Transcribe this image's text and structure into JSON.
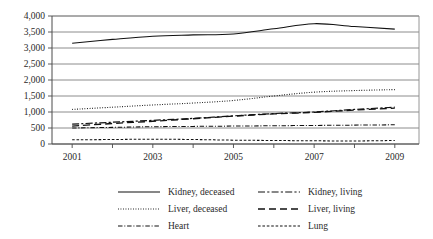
{
  "chart_data": {
    "type": "line",
    "title": "",
    "subtitle": "",
    "xlabel": "",
    "ylabel": "",
    "x": [
      2001,
      2002,
      2003,
      2004,
      2005,
      2006,
      2007,
      2008,
      2009
    ],
    "xlim": [
      2000.5,
      2009.6
    ],
    "ylim": [
      0,
      4000
    ],
    "ytick_values": [
      0,
      500,
      1000,
      1500,
      2000,
      2500,
      3000,
      3500,
      4000
    ],
    "ytick_labels": [
      "0",
      "500",
      "1,000",
      "1,500",
      "2,000",
      "2,500",
      "3,000",
      "3,500",
      "4,000"
    ],
    "xtick_values": [
      2001,
      2002,
      2003,
      2004,
      2005,
      2006,
      2007,
      2008,
      2009
    ],
    "xtick_labels": [
      "2001",
      "",
      "2003",
      "",
      "2005",
      "",
      "2007",
      "",
      "2009"
    ],
    "xtick_labels_shown": [
      "2001",
      "2003",
      "2005",
      "2007",
      "2009"
    ],
    "grid": "horizontal",
    "legend_position": "bottom",
    "series": [
      {
        "name": "Kidney, deceased",
        "dash": "solid",
        "values": [
          3150,
          3270,
          3370,
          3410,
          3440,
          3600,
          3760,
          3670,
          3590
        ]
      },
      {
        "name": "Kidney, living",
        "dash": "long-dash-dot",
        "values": [
          620,
          680,
          740,
          800,
          880,
          950,
          1000,
          1080,
          1150
        ]
      },
      {
        "name": "Liver, deceased",
        "dash": "dotted",
        "values": [
          1080,
          1150,
          1220,
          1280,
          1360,
          1500,
          1620,
          1670,
          1700
        ]
      },
      {
        "name": "Liver, living",
        "dash": "dashed",
        "values": [
          560,
          640,
          710,
          790,
          870,
          940,
          990,
          1060,
          1120
        ]
      },
      {
        "name": "Heart",
        "dash": "dash-dot",
        "values": [
          500,
          520,
          540,
          550,
          560,
          570,
          580,
          590,
          600
        ]
      },
      {
        "name": "Lung",
        "dash": "short-dash",
        "values": [
          130,
          140,
          150,
          140,
          120,
          110,
          100,
          95,
          110
        ]
      }
    ]
  },
  "legend": {
    "entries": [
      {
        "label": "Kidney, deceased",
        "dash": "solid"
      },
      {
        "label": "Kidney, living",
        "dash": "long-dash-dot"
      },
      {
        "label": "Liver, deceased",
        "dash": "dotted"
      },
      {
        "label": "Liver, living",
        "dash": "dashed"
      },
      {
        "label": "Heart",
        "dash": "dash-dot"
      },
      {
        "label": "Lung",
        "dash": "short-dash"
      }
    ]
  },
  "colors": {
    "line": "#111111",
    "grid": "#6e6e6e",
    "axis": "#4a4a4a",
    "text": "#2a2a2a",
    "background": "#ffffff"
  }
}
